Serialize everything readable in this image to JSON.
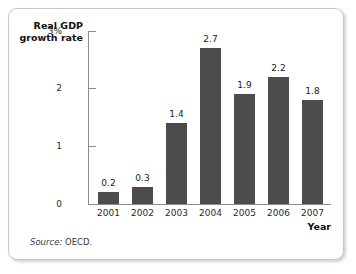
{
  "chart_data": {
    "type": "bar",
    "title": "",
    "subtitle": "",
    "categories": [
      "2001",
      "2002",
      "2003",
      "2004",
      "2005",
      "2006",
      "2007"
    ],
    "values": [
      0.2,
      0.3,
      1.4,
      2.7,
      1.9,
      2.2,
      1.8
    ],
    "value_labels": [
      "0.2",
      "0.3",
      "1.4",
      "2.7",
      "1.9",
      "2.2",
      "1.8"
    ],
    "series": [
      {
        "name": "Real GDP growth rate",
        "values": [
          0.2,
          0.3,
          1.4,
          2.7,
          1.9,
          2.2,
          1.8
        ]
      }
    ],
    "xlabel": "Year",
    "ylabel": "Real GDP growth rate",
    "ylabel_lines": [
      "Real GDP",
      "growth rate"
    ],
    "ylim": [
      0,
      3
    ],
    "yticks": [
      0,
      1,
      2,
      3
    ],
    "ytick_labels": [
      "0",
      "1",
      "2",
      "3%"
    ],
    "grid": false,
    "legend": false,
    "legend_position": "none",
    "bar_color": "#4c4c4c",
    "axis_color": "#8c8c8c",
    "background_color": "#ffffff"
  },
  "notes": {
    "source_label": "Source:",
    "source_value": "OECD."
  }
}
